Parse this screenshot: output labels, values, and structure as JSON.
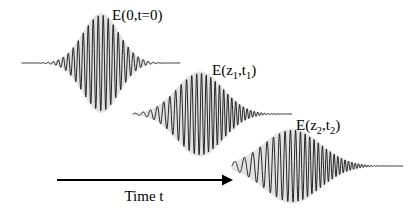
{
  "figure": {
    "background_color": "#ffffff",
    "wave_color": "#1a1a1a",
    "envelope_color": "#e3e3e3",
    "arrow_color": "#000000"
  },
  "axis": {
    "time_label": "Time t",
    "arrow": {
      "x_start": 57,
      "x_end": 231,
      "y": 180
    },
    "label_position": {
      "x": 144,
      "y": 201
    }
  },
  "labels": [
    {
      "id": "label-pulse-1",
      "text_main": "E(0,t=0)",
      "base": "E(0,t=0)",
      "x": 112,
      "y": 20
    },
    {
      "id": "label-pulse-2",
      "text_main": "E(z",
      "sub1": "1",
      "mid": ",t",
      "sub2": "1",
      "tail": ")",
      "x": 212,
      "y": 75
    },
    {
      "id": "label-pulse-3",
      "text_main": "E(z",
      "sub1": "2",
      "mid": ",t",
      "sub2": "2",
      "tail": ")",
      "x": 296,
      "y": 130
    }
  ],
  "chart_data": {
    "type": "line",
    "xlabel": "Time t",
    "ylabel": "",
    "grid": false,
    "legend": "none",
    "series": [
      {
        "name": "E(0,t=0)",
        "baseline_y": 63,
        "x_start": 22,
        "x_end": 180,
        "envelope_center": 101,
        "envelope_width": 26,
        "amplitude": 48,
        "carrier_period_start": 5.0,
        "carrier_period_end": 5.0,
        "chirp": 0.0,
        "envelope_shape": "gaussian",
        "note": "transform-limited, unchirped symmetric pulse"
      },
      {
        "name": "E(z1,t1)",
        "baseline_y": 114,
        "x_start": 133,
        "x_end": 292,
        "envelope_center": 200,
        "envelope_width": 33,
        "amplitude": 41,
        "carrier_period_start": 8.5,
        "carrier_period_end": 3.0,
        "chirp": 0.55,
        "envelope_shape": "gaussian",
        "note": "moderately broadened and up-chirped"
      },
      {
        "name": "E(z2,t2)",
        "baseline_y": 166,
        "x_start": 232,
        "x_end": 403,
        "envelope_center": 292,
        "envelope_width": 40,
        "amplitude": 36,
        "carrier_period_start": 11.0,
        "carrier_period_end": 2.6,
        "chirp": 0.85,
        "envelope_shape": "gaussian",
        "note": "strongly broadened and strongly up-chirped"
      }
    ],
    "axis_arrow": {
      "label": "Time t",
      "from_x": 57,
      "to_x": 231,
      "y": 180
    }
  }
}
